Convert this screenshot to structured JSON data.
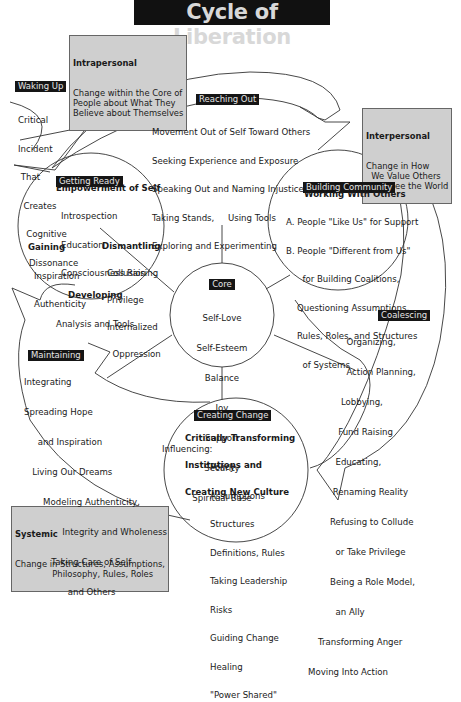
{
  "title": "Cycle of Liberation",
  "boxes": {
    "intrapersonal": {
      "heading": "Intrapersonal",
      "body": "Change within the Core of\nPeople about What They\nBelieve about Themselves"
    },
    "interpersonal": {
      "heading": "Interpersonal",
      "body": "Change in How\n  We Value Others\n  and See the World"
    },
    "systemic": {
      "heading": "Systemic",
      "body": "Change in Structures, Assumptions,\n              Philosophy, Rules, Roles"
    }
  },
  "stages": {
    "waking_up": {
      "label": "Waking Up",
      "lines": [
        "Critical",
        "Incident",
        " That",
        "  Creates",
        "   Cognitive",
        "    Dissonance"
      ]
    },
    "reaching_out": {
      "label": "Reaching Out",
      "lines": [
        "Movement Out of Self Toward Others",
        "Seeking Experience and Exposure",
        "Speaking Out and Naming Injustices",
        "Taking Stands,     Using Tools",
        "Exploring and Experimenting"
      ]
    },
    "getting_ready": {
      "label": "Getting Ready",
      "heading": "Empowerment of Self",
      "lines": [
        "Introspection",
        "Education",
        "Consciousness Raising"
      ],
      "gaining": {
        "heading": "Gaining",
        "lines": [
          "Inspiration",
          "Authenticity"
        ]
      },
      "dismantling": {
        "heading": "Dismantling",
        "lines": [
          "Collusion",
          "Privilege",
          "Internalized",
          "  Oppression"
        ]
      },
      "developing": {
        "heading": "Developing",
        "lines": [
          "Analysis and Tools"
        ]
      }
    },
    "building_community": {
      "label": "Building Community",
      "heading": "Working With Others",
      "lines": [
        "A. People \"Like Us\" for Support",
        "B. People \"Different from Us\"",
        "      for Building Coalitions,",
        "    Questioning Assumptions,",
        "    Rules, Roles, and Structures",
        "      of Systems"
      ]
    },
    "core": {
      "label": "Core",
      "lines": [
        "Self-Love",
        "Self-Esteem",
        "Balance",
        "Joy",
        "Support",
        "Security",
        "Spiritual Base"
      ]
    },
    "maintaining": {
      "label": "Maintaining",
      "lines": [
        "Integrating",
        "Spreading Hope",
        "     and Inspiration",
        "   Living Our Dreams",
        "       Modeling Authenticity,",
        "              Integrity and Wholeness",
        "          Taking Care of Self",
        "                and Others"
      ]
    },
    "coalescing": {
      "label": "Coalescing",
      "lines": [
        "      Organizing,",
        "      Action Planning,",
        "    Lobbying,",
        "   Fund Raising",
        "  Educating,",
        " Renaming Reality",
        "Refusing to Collude",
        "  or Take Privilege",
        "Being a Role Model,",
        "  an Ally",
        "Transforming Anger",
        "Moving Into Action"
      ]
    },
    "creating_change": {
      "label": "Creating Change",
      "heading_lines": [
        "Critically Transforming",
        "Institutions and",
        "Creating New Culture"
      ],
      "influencing_label": "Influencing:",
      "lines": [
        "Policy",
        "Assumptions",
        "Structures",
        "Definitions, Rules",
        "Taking Leadership",
        "Risks",
        "Guiding Change",
        "Healing",
        "\"Power Shared\""
      ]
    }
  },
  "colors": {
    "label_bg": "#151515",
    "label_text": "#e6e6e6",
    "box_bg": "#cfcfcf",
    "line": "#333333"
  }
}
